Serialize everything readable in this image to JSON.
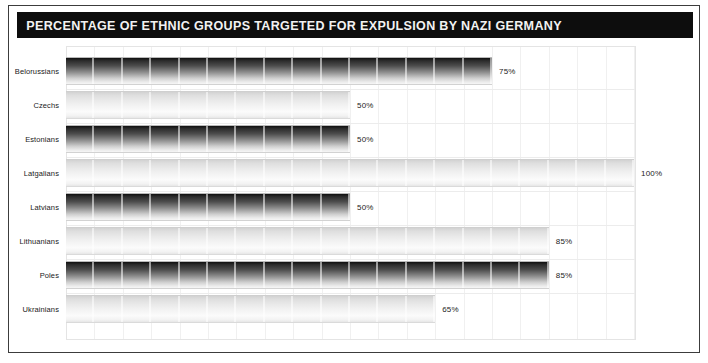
{
  "header": {
    "title": "PERCENTAGE OF ETHNIC GROUPS TARGETED FOR EXPULSION BY NAZI GERMANY",
    "background_color": "#0d0d0d",
    "text_color": "#f2f2f2"
  },
  "chart_data": {
    "type": "bar",
    "orientation": "horizontal",
    "title": "PERCENTAGE OF ETHNIC GROUPS TARGETED FOR EXPULSION BY NAZI GERMANY",
    "xlabel": "",
    "ylabel": "",
    "xlim": [
      0,
      100
    ],
    "grid": true,
    "grid_interval": 5,
    "legend": "none",
    "unit": "%",
    "categories": [
      "Belorussians",
      "Czechs",
      "Estonians",
      "Latgalians",
      "Latvians",
      "Lithuanians",
      "Poles",
      "Ukrainians"
    ],
    "values": [
      75,
      50,
      50,
      100,
      50,
      85,
      85,
      65
    ],
    "value_labels": [
      "75%",
      "50%",
      "50%",
      "100%",
      "50%",
      "85%",
      "85%",
      "65%"
    ],
    "bar_styles": [
      "dark",
      "light",
      "dark",
      "light",
      "dark",
      "light",
      "dark",
      "light"
    ]
  },
  "colors": {
    "frame_border": "#3c3c3c",
    "plot_border": "#e4e4e4",
    "gridline": "#f0f0f0",
    "bar_dark_top": "#0f0f0f",
    "bar_dark_bottom": "#f6f6f6",
    "bar_light_top": "#d2d2d2",
    "bar_light_bottom": "#e6e6e6",
    "label_text": "#1a1a1a",
    "value_text": "#232323",
    "background": "#ffffff"
  }
}
